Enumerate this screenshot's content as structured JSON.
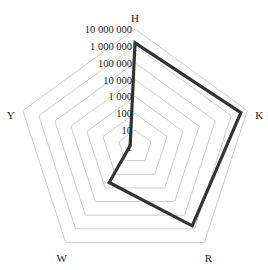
{
  "chart_data": {
    "type": "radar",
    "title": "",
    "scale": "log10",
    "axes": [
      "H",
      "K",
      "R",
      "W",
      "Y"
    ],
    "tick_labels": [
      "1",
      "10",
      "100",
      "1 000",
      "10 000",
      "100 000",
      "1 000 000",
      "10 000 000"
    ],
    "range": [
      1,
      10000000
    ],
    "grid": true,
    "legend": false,
    "series": [
      {
        "name": "series-1",
        "values": [
          1500000,
          4000000,
          600000,
          400,
          2
        ],
        "color": "#333333"
      }
    ],
    "grid_color": "#cccccc"
  }
}
